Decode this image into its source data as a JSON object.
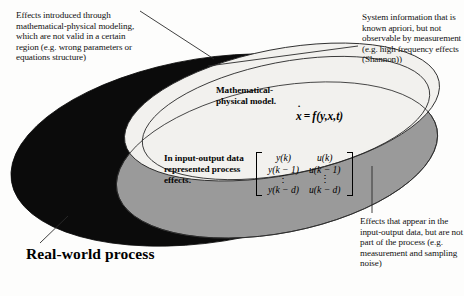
{
  "diagram": {
    "colors": {
      "real_world_process_fill": "#0b0b0b",
      "input_output_data_fill": "#9a9a9a",
      "mathematical_model_fill": "#f2f1ee",
      "outline": "#1a1a1a",
      "page_background": "#fdfdfc"
    }
  },
  "annotations": {
    "top_left": "Effects introduced through mathematical-physical modeling, which are not valid in a certain region (e.g. wrong parameters or equations structure)",
    "top_right": "System information that is known apriori, but not observable by measurement (e.g. high frequency effects (Shannon))",
    "bottom_right": "Effects that appear in the input-output data, but are not part of the process (e.g. measurement and sampling noise)"
  },
  "regions": {
    "real_world_process_label": "Real-world process",
    "model_label": "Mathematical-physical model.",
    "input_output_label": "In input-output data represented process effects."
  },
  "equation": {
    "state_symbol": "x",
    "operator": "=",
    "right_hand_side": "f(y,x,t)",
    "full": "ẋ = f(y,x,t)"
  },
  "matrix": {
    "rows": [
      [
        "y(k)",
        "u(k)"
      ],
      [
        "y(k − 1)",
        "u(k − 1)"
      ],
      [
        "⋮",
        "⋮"
      ],
      [
        "y(k − d)",
        "u(k − d)"
      ]
    ]
  }
}
